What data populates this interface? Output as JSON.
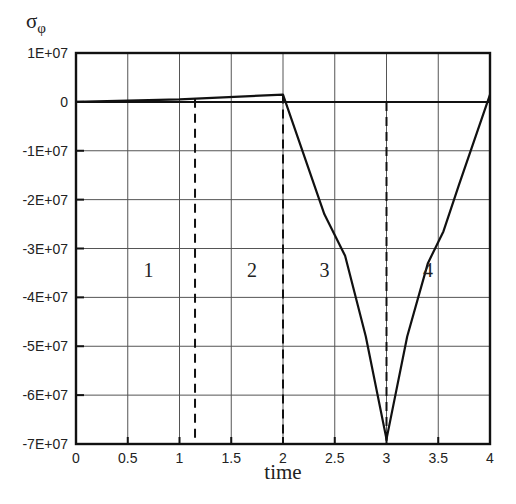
{
  "chart_data": {
    "type": "line",
    "title": "",
    "ylabel": "σφ",
    "xlabel": "time",
    "xlim": [
      0,
      4
    ],
    "ylim": [
      -70000000,
      10000000
    ],
    "grid": true,
    "legend": null,
    "x_ticks": [
      0,
      0.5,
      1,
      1.5,
      2,
      2.5,
      3,
      3.5,
      4
    ],
    "x_tick_labels": [
      "0",
      "0.5",
      "1",
      "1.5",
      "2",
      "2.5",
      "3",
      "3.5",
      "4"
    ],
    "y_ticks": [
      10000000,
      0,
      -10000000,
      -20000000,
      -30000000,
      -40000000,
      -50000000,
      -60000000,
      -70000000
    ],
    "y_tick_labels": [
      "1E+07",
      "0",
      "-1E+07",
      "-2E+07",
      "-3E+07",
      "-4E+07",
      "-5E+07",
      "-6E+07",
      "-7E+07"
    ],
    "series": [
      {
        "name": "σφ",
        "x": [
          0,
          1,
          2,
          2.4,
          2.6,
          2.8,
          3.0,
          3.2,
          3.4,
          3.55,
          3.7,
          4.0
        ],
        "y": [
          0,
          500000,
          1500000,
          -23000000,
          -31500000,
          -48000000,
          -69000000,
          -48000000,
          -33000000,
          -26500000,
          -17000000,
          1500000
        ]
      }
    ],
    "phase_dividers": [
      1.15,
      2.0,
      3.0
    ],
    "annotations": [
      {
        "text": "1",
        "x": 0.7,
        "y": -35000000
      },
      {
        "text": "2",
        "x": 1.7,
        "y": -35000000
      },
      {
        "text": "3",
        "x": 2.4,
        "y": -35000000
      },
      {
        "text": "4",
        "x": 3.4,
        "y": -35000000
      }
    ]
  },
  "labels": {
    "y_axis": "σ",
    "y_axis_sub": "φ",
    "x_axis": "time"
  }
}
